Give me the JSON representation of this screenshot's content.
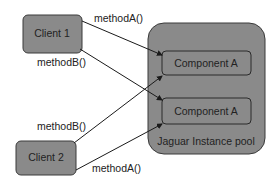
{
  "diagram": {
    "clients": [
      {
        "id": "client1",
        "label": "Client 1"
      },
      {
        "id": "client2",
        "label": "Client 2"
      }
    ],
    "pool": {
      "label": "Jaguar Instance pool",
      "components": [
        {
          "id": "compA1",
          "label": "Component A"
        },
        {
          "id": "compA2",
          "label": "Component A"
        }
      ]
    },
    "calls": [
      {
        "from": "client1",
        "to": "compA1",
        "label": "methodA()"
      },
      {
        "from": "client1",
        "to": "compA2",
        "label": "methodB()"
      },
      {
        "from": "client2",
        "to": "compA1",
        "label": "methodB()"
      },
      {
        "from": "client2",
        "to": "compA2",
        "label": "methodA()"
      }
    ],
    "colors": {
      "box_fill": "#8a8a8a",
      "box_stroke": "#3a3a3a",
      "line": "#1a1a1a",
      "background": "#ffffff"
    }
  }
}
